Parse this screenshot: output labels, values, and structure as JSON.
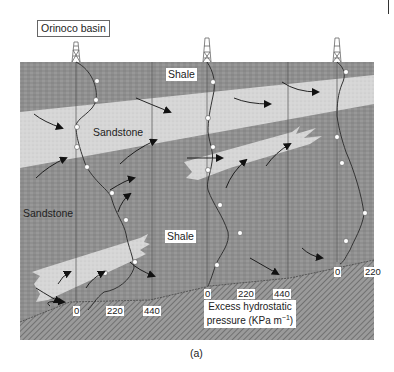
{
  "figure": {
    "basin_label": "Orinoco basin",
    "caption": "(a)",
    "layers": {
      "shale_upper": "Shale",
      "sandstone_upper": "Sandstone",
      "sandstone_lower": "Sandstone",
      "shale_lower": "Shale"
    },
    "pressure_axis": {
      "line1": "Excess hydrostatic",
      "line2": "pressure (KPa m",
      "unit_sup": "−1",
      "close": ")"
    },
    "wells": [
      {
        "name": "well-1",
        "ticks": [
          "0",
          "220",
          "440"
        ]
      },
      {
        "name": "well-2",
        "ticks": [
          "0",
          "220",
          "440"
        ]
      },
      {
        "name": "well-3",
        "ticks": [
          "0",
          "220"
        ]
      }
    ],
    "colors": {
      "shale": "#8f8f8f",
      "sandstone": "#d9d9d9",
      "basement": "#7a7a7a",
      "arrow": "#111111",
      "profile": "#333333"
    }
  }
}
